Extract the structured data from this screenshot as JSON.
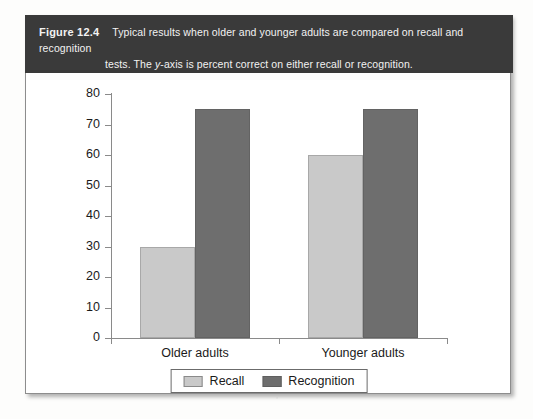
{
  "figure": {
    "label": "Figure 12.4",
    "caption_line1": "Typical results when older and younger adults are compared on recall and recognition",
    "caption_line2_pre": "tests. The ",
    "caption_line2_ital": "y",
    "caption_line2_post": "-axis is percent correct on either recall or recognition.",
    "header_color": "#3a3a3a",
    "border_color": "#8d8d8d"
  },
  "chart_data": {
    "type": "bar",
    "title": "",
    "xlabel": "",
    "ylabel": "",
    "ylim": [
      0,
      80
    ],
    "yticks": [
      0,
      10,
      20,
      30,
      40,
      50,
      60,
      70,
      80
    ],
    "ytick_labels": [
      "0",
      "10",
      "20",
      "30",
      "40",
      "50",
      "60",
      "70",
      "80"
    ],
    "grid": false,
    "legend_position": "bottom-center",
    "categories": [
      "Older adults",
      "Younger adults"
    ],
    "series": [
      {
        "name": "Recall",
        "values": [
          30,
          60
        ],
        "color": "#c9c9c9"
      },
      {
        "name": "Recognition",
        "values": [
          75,
          75
        ],
        "color": "#6e6e6e"
      }
    ]
  }
}
